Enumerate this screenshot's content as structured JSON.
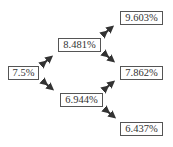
{
  "diagram": {
    "type": "binomial-interest-rate-tree",
    "nodes": {
      "root": "7.5%",
      "up1": "8.481%",
      "down1": "6.944%",
      "upup2": "9.603%",
      "updown2": "7.862%",
      "downdown2": "6.437%"
    },
    "colors": {
      "border": "#555555",
      "text": "#333333",
      "arrow": "#333333",
      "background": "#ffffff"
    }
  }
}
